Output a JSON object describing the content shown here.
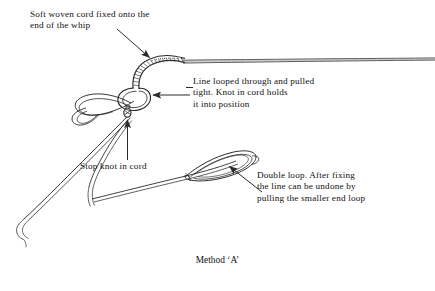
{
  "figure": {
    "caption": "Method ‘A’",
    "ink_color": "#2b2b2b",
    "background_color": "#ffffff",
    "annotations": [
      {
        "id": "cord",
        "text": "Soft woven cord fixed onto the\nend of the whip",
        "leader": "diagonal-arrow-down-right"
      },
      {
        "id": "looped",
        "text": "Line looped through and pulled\ntight. Knot in cord holds\nit into position",
        "leader": "horizontal-arrow-left"
      },
      {
        "id": "stopknot",
        "text": "Stop knot in cord",
        "leader": "vertical-arrow-up"
      },
      {
        "id": "doubleloop",
        "text": "Double loop. After fixing\nthe line can be undone by\npulling the smaller end loop",
        "leader": "diagonal-arrow-up-left"
      }
    ],
    "parts": [
      {
        "name": "whip-shaft",
        "description": "tapered whip body running to the right edge"
      },
      {
        "name": "braided-cord",
        "description": "soft woven cord plaited onto the whip end"
      },
      {
        "name": "stop-knot",
        "description": "small knot tied in the cord"
      },
      {
        "name": "cord-loop",
        "description": "loop formed in the cord through which the line passes"
      },
      {
        "name": "line-double-loop",
        "description": "elongated double loop formed in the line"
      },
      {
        "name": "line-tails",
        "description": "two thin line tails falling to the lower left"
      }
    ]
  }
}
